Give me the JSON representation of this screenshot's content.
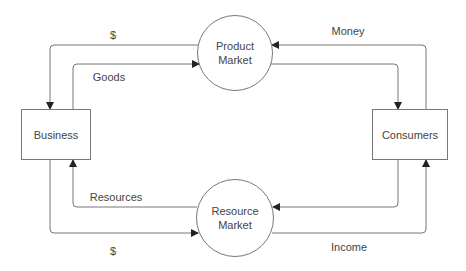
{
  "diagram": {
    "colors": {
      "line": "#777777",
      "text": "#444444",
      "background": "#ffffff"
    },
    "nodes": {
      "business": {
        "label": "Business"
      },
      "consumers": {
        "label": "Consumers"
      },
      "product_market": {
        "line1": "Product",
        "line2": "Market"
      },
      "resource_market": {
        "line1": "Resource",
        "line2": "Market"
      }
    },
    "flows": [
      {
        "label": "$",
        "from": "Product Market",
        "to": "Business"
      },
      {
        "label": "Goods",
        "from": "Business",
        "to": "Product Market"
      },
      {
        "label": "Money",
        "from": "Consumers",
        "to": "Product Market"
      },
      {
        "label": "",
        "from": "Product Market",
        "to": "Consumers"
      },
      {
        "label": "Resources",
        "from": "Resource Market",
        "to": "Business"
      },
      {
        "label": "$",
        "from": "Business",
        "to": "Resource Market"
      },
      {
        "label": "",
        "from": "Consumers",
        "to": "Resource Market"
      },
      {
        "label": "Income",
        "from": "Resource Market",
        "to": "Consumers"
      }
    ]
  }
}
